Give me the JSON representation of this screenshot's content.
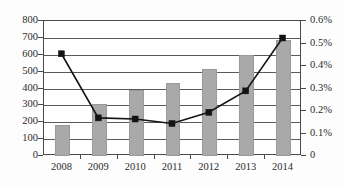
{
  "chart_data": {
    "type": "bar",
    "title": "",
    "xlabel": "",
    "categories": [
      "2008",
      "2009",
      "2010",
      "2011",
      "2012",
      "2013",
      "2014"
    ],
    "grid": true,
    "legend_position": "none",
    "series": [
      {
        "name": "bars",
        "type": "bar",
        "axis": "left",
        "values": [
          185,
          310,
          390,
          435,
          515,
          600,
          690
        ],
        "color": "#a9a9a9"
      },
      {
        "name": "line",
        "type": "line",
        "axis": "right",
        "values": [
          0.45,
          0.165,
          0.16,
          0.14,
          0.19,
          0.285,
          0.52
        ],
        "value_labels": [
          "0.45%",
          "0.165%",
          "0.16%",
          "0.14%",
          "0.19%",
          "0.285%",
          "0.52%"
        ],
        "color": "#141414",
        "marker": "square"
      }
    ],
    "left_axis": {
      "ylabel": "",
      "ylim": [
        0,
        800
      ],
      "ticks": [
        0,
        100,
        200,
        300,
        400,
        500,
        600,
        700,
        800
      ],
      "tick_labels": [
        "0",
        "100",
        "200",
        "300",
        "400",
        "500",
        "600",
        "700",
        "800"
      ]
    },
    "right_axis": {
      "ylabel": "",
      "ylim": [
        0,
        0.6
      ],
      "ticks": [
        0,
        0.1,
        0.2,
        0.3,
        0.4,
        0.5,
        0.6
      ],
      "tick_labels": [
        "0",
        "0.1%",
        "0.2%",
        "0.3%",
        "0.4%",
        "0.5%",
        "0.6%"
      ]
    }
  }
}
